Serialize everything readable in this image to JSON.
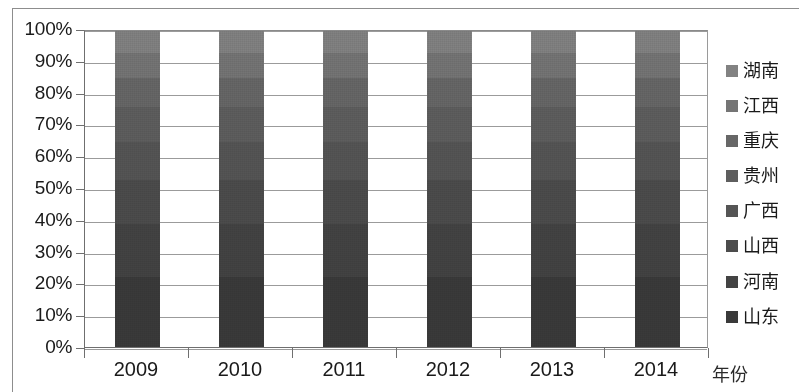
{
  "chart_data": {
    "type": "bar",
    "subtype": "100% stacked column",
    "title": "",
    "xlabel": "年份",
    "ylabel": "",
    "categories": [
      "2009",
      "2010",
      "2011",
      "2012",
      "2013",
      "2014"
    ],
    "ylim": [
      0,
      100
    ],
    "ytick_labels": [
      "0%",
      "10%",
      "20%",
      "30%",
      "40%",
      "50%",
      "60%",
      "70%",
      "80%",
      "90%",
      "100%"
    ],
    "ytick_values": [
      0,
      10,
      20,
      30,
      40,
      50,
      60,
      70,
      80,
      90,
      100
    ],
    "grid": true,
    "legend_position": "right",
    "legend_order_top_to_bottom": [
      "湖南",
      "江西",
      "重庆",
      "贵州",
      "广西",
      "山西",
      "河南",
      "山东"
    ],
    "stack_order_bottom_to_top": [
      "山东",
      "河南",
      "山西",
      "广西",
      "贵州",
      "重庆",
      "江西",
      "湖南"
    ],
    "series": [
      {
        "name": "山东",
        "color": "#3a3a3a",
        "values": [
          22,
          22,
          22,
          22,
          22,
          22
        ]
      },
      {
        "name": "河南",
        "color": "#434343",
        "values": [
          17,
          17,
          17,
          17,
          17,
          17
        ]
      },
      {
        "name": "山西",
        "color": "#4c4c4c",
        "values": [
          14,
          14,
          14,
          14,
          14,
          14
        ]
      },
      {
        "name": "广西",
        "color": "#555555",
        "values": [
          12,
          12,
          12,
          12,
          12,
          12
        ]
      },
      {
        "name": "贵州",
        "color": "#5e5e5e",
        "values": [
          11,
          11,
          11,
          11,
          11,
          11
        ]
      },
      {
        "name": "重庆",
        "color": "#676767",
        "values": [
          9,
          9,
          9,
          9,
          9,
          9
        ]
      },
      {
        "name": "江西",
        "color": "#757575",
        "values": [
          8,
          8,
          8,
          8,
          8,
          8
        ]
      },
      {
        "name": "湖南",
        "color": "#828282",
        "values": [
          7,
          7,
          7,
          7,
          7,
          7
        ]
      }
    ]
  },
  "legend": {
    "items": [
      {
        "label": "湖南",
        "color": "#828282"
      },
      {
        "label": "江西",
        "color": "#757575"
      },
      {
        "label": "重庆",
        "color": "#676767"
      },
      {
        "label": "贵州",
        "color": "#5e5e5e"
      },
      {
        "label": "广西",
        "color": "#555555"
      },
      {
        "label": "山西",
        "color": "#4c4c4c"
      },
      {
        "label": "河南",
        "color": "#434343"
      },
      {
        "label": "山东",
        "color": "#3a3a3a"
      }
    ]
  },
  "axes": {
    "x_title": "年份",
    "x_labels": [
      "2009",
      "2010",
      "2011",
      "2012",
      "2013",
      "2014"
    ],
    "y_labels": [
      "100%",
      "90%",
      "80%",
      "70%",
      "60%",
      "50%",
      "40%",
      "30%",
      "20%",
      "10%",
      "0%"
    ]
  }
}
